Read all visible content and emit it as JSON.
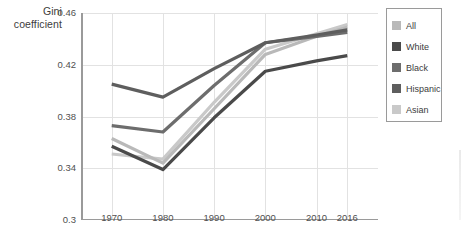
{
  "axis_title": "Gini\ncoefficient",
  "axis_title_line1": "Gini",
  "axis_title_line2": "coefficient",
  "legend": {
    "items": [
      {
        "label": "All",
        "color": "#b9b9b9"
      },
      {
        "label": "White",
        "color": "#4a4a4a"
      },
      {
        "label": "Black",
        "color": "#6d6d6d"
      },
      {
        "label": "Hispanic",
        "color": "#5e5e5e"
      },
      {
        "label": "Asian",
        "color": "#c9c9c9"
      }
    ]
  },
  "chart_data": {
    "type": "line",
    "title": "",
    "xlabel": "",
    "ylabel": "Gini coefficient",
    "x": [
      1970,
      1980,
      1990,
      2000,
      2010,
      2016
    ],
    "xticklabels": [
      "1970",
      "1980",
      "1990",
      "2000",
      "2010",
      "2016"
    ],
    "yticklabels": [
      "0.3",
      "0.34",
      "0.38",
      "0.42",
      "0.46"
    ],
    "yticks": [
      0.3,
      0.34,
      0.38,
      0.42,
      0.46
    ],
    "ylim": [
      0.3,
      0.46
    ],
    "xlim": [
      1964,
      2022
    ],
    "grid": true,
    "legend_position": "right",
    "series": [
      {
        "name": "All",
        "color": "#b9b9b9",
        "values": [
          0.363,
          0.344,
          0.386,
          0.428,
          0.442,
          0.449
        ]
      },
      {
        "name": "White",
        "color": "#4a4a4a",
        "values": [
          0.357,
          0.339,
          0.379,
          0.415,
          0.423,
          0.427
        ]
      },
      {
        "name": "Black",
        "color": "#6d6d6d",
        "values": [
          0.373,
          0.368,
          0.404,
          0.437,
          0.442,
          0.445
        ]
      },
      {
        "name": "Hispanic",
        "color": "#5e5e5e",
        "values": [
          0.405,
          0.395,
          0.417,
          0.437,
          0.443,
          0.447
        ]
      },
      {
        "name": "Asian",
        "color": "#c9c9c9",
        "values": [
          0.351,
          0.347,
          0.391,
          0.432,
          0.444,
          0.451
        ]
      }
    ]
  }
}
